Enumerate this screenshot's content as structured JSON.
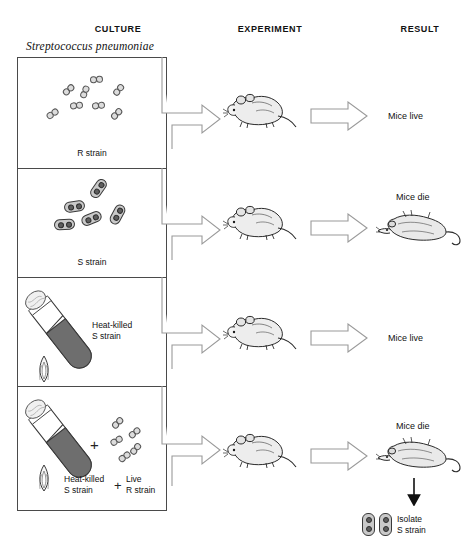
{
  "headers": {
    "culture": "CULTURE",
    "experiment": "EXPERIMENT",
    "result": "RESULT"
  },
  "species_label": "Streptococcus pneumoniae",
  "rows": [
    {
      "culture_label": "R strain",
      "culture_type": "r-strain-cells",
      "mouse_state": "live-mouse",
      "result": "Mice live",
      "result_mouse": "none"
    },
    {
      "culture_label": "S strain",
      "culture_type": "s-strain-cells",
      "mouse_state": "live-mouse",
      "result": "Mice die",
      "result_mouse": "dead-mouse"
    },
    {
      "culture_label_line1": "Heat-killed",
      "culture_label_line2": "S strain",
      "culture_type": "heated-test-tube",
      "mouse_state": "live-mouse",
      "result": "Mice live",
      "result_mouse": "none"
    },
    {
      "culture_label_line1": "Heat-killed",
      "culture_label_line2": "S strain",
      "culture_label2_line1": "Live",
      "culture_label2_line2": "R strain",
      "plus_symbol": "+",
      "culture_type": "heated-test-tube-plus-r-cells",
      "mouse_state": "live-mouse",
      "result": "Mice die",
      "result_mouse": "dead-mouse",
      "isolate_line1": "Isolate",
      "isolate_line2": "S strain"
    }
  ],
  "colors": {
    "ink": "#1a1a1a",
    "panel_border": "#4a4a4a",
    "arrow_outline": "#9a9a9a",
    "cell_fill_r": "#dcdcdc",
    "cell_fill_s": "#c9c9c9",
    "tube_medium": "#6e6e6e"
  }
}
